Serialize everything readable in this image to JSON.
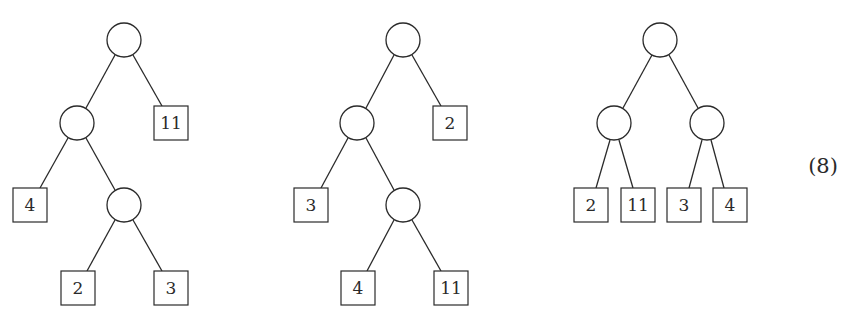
{
  "figure": {
    "equation_label": "(8)",
    "trees": [
      {
        "name": "tree-1",
        "internal_nodes": [
          {
            "id": "root",
            "cx": 124,
            "cy": 40
          },
          {
            "id": "left",
            "cx": 77,
            "cy": 123
          },
          {
            "id": "left-right",
            "cx": 124,
            "cy": 205
          }
        ],
        "leaves": [
          {
            "label": "11",
            "x": 154,
            "y": 106
          },
          {
            "label": "4",
            "x": 13,
            "y": 188
          },
          {
            "label": "2",
            "x": 61,
            "y": 271
          },
          {
            "label": "3",
            "x": 154,
            "y": 271
          }
        ]
      },
      {
        "name": "tree-2",
        "internal_nodes": [
          {
            "id": "root",
            "cx": 403,
            "cy": 40
          },
          {
            "id": "left",
            "cx": 357,
            "cy": 123
          },
          {
            "id": "left-right",
            "cx": 403,
            "cy": 205
          }
        ],
        "leaves": [
          {
            "label": "2",
            "x": 433,
            "y": 106
          },
          {
            "label": "3",
            "x": 294,
            "y": 188
          },
          {
            "label": "4",
            "x": 341,
            "y": 271
          },
          {
            "label": "11",
            "x": 434,
            "y": 271
          }
        ]
      },
      {
        "name": "tree-3",
        "internal_nodes": [
          {
            "id": "root",
            "cx": 660,
            "cy": 40
          },
          {
            "id": "left",
            "cx": 614,
            "cy": 123
          },
          {
            "id": "right",
            "cx": 707,
            "cy": 123
          }
        ],
        "leaves": [
          {
            "label": "2",
            "x": 574,
            "y": 188
          },
          {
            "label": "11",
            "x": 621,
            "y": 188
          },
          {
            "label": "3",
            "x": 667,
            "y": 188
          },
          {
            "label": "4",
            "x": 713,
            "y": 188
          }
        ]
      }
    ]
  }
}
